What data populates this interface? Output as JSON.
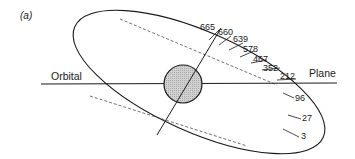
{
  "figure": {
    "panel_label": "(a)",
    "axis_labels": {
      "left": "Orbital",
      "right": "Plane"
    },
    "orbit_markers": [
      {
        "label": "665"
      },
      {
        "label": "660"
      },
      {
        "label": "639"
      },
      {
        "label": "578"
      },
      {
        "label": "467"
      },
      {
        "label": "352"
      },
      {
        "label": "212"
      },
      {
        "label": "96"
      },
      {
        "label": "27"
      },
      {
        "label": "3"
      }
    ],
    "colors": {
      "line": "#1a1a1a",
      "body_fill": "#c8c8c8",
      "background": "#ffffff"
    }
  }
}
